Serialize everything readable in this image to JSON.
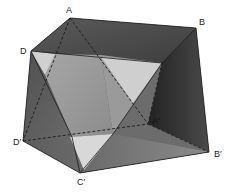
{
  "figure": {
    "type": "solid-geometry",
    "vertices": {
      "A": {
        "label": "A",
        "x": 70,
        "y": 18
      },
      "B": {
        "label": "B",
        "x": 196,
        "y": 28
      },
      "D": {
        "label": "D",
        "x": 31,
        "y": 51
      },
      "D1": {
        "label": "D′",
        "x": 23,
        "y": 141
      },
      "C1": {
        "label": "C′",
        "x": 80,
        "y": 173
      },
      "B1": {
        "label": "B′",
        "x": 209,
        "y": 152
      },
      "A1": {
        "label": "A′",
        "x": 148,
        "y": 124
      }
    },
    "labels": {
      "A": "A",
      "B": "B",
      "D": "D",
      "D1": "D′",
      "C1": "C′",
      "B1": "B′",
      "A1": "A′"
    },
    "colors": {
      "background": "#ffffff",
      "face_dark": "#3a3a3a",
      "face_mid": "#6e6e6e",
      "face_light": "#a8a8a8",
      "face_lightest": "#d4d4d4",
      "edge": "#1c1c1c"
    }
  }
}
